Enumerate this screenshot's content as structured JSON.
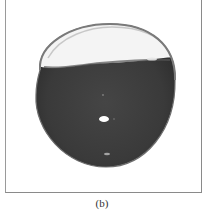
{
  "figure": {
    "panel_label": "(b)",
    "image_description": "photograph of a liquid droplet/sphere, partially filled with dark fluid, with bright upper meniscus region and a specular highlight",
    "colors": {
      "fluid": "#3f3f3f",
      "fluid_dark": "#2e2e2e",
      "rim": "#7a7a7a",
      "upper_void": "#f4f4f4",
      "highlight": "#ffffff",
      "frame": "#8a8a8a"
    }
  }
}
